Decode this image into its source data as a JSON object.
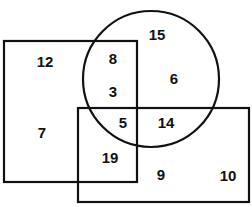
{
  "diagram": {
    "type": "venn-diagram",
    "title": "",
    "background_color": "#ffffff",
    "stroke_color": "#111111",
    "label_color": "#111111",
    "sets": [
      {
        "name": "left-rectangle",
        "shape": "rectangle",
        "x": 4,
        "y": 41,
        "width": 133,
        "height": 141
      },
      {
        "name": "bottom-rectangle",
        "shape": "rectangle",
        "x": 78,
        "y": 108,
        "width": 171,
        "height": 94
      },
      {
        "name": "circle",
        "shape": "circle",
        "cx": 151,
        "cy": 79,
        "r": 68
      }
    ],
    "regions": [
      {
        "id": "rect-left-only-top",
        "value": "12",
        "x": 45,
        "y": 63
      },
      {
        "id": "rect-left-only-bottom",
        "value": "7",
        "x": 42,
        "y": 134
      },
      {
        "id": "circle-rect-left-top",
        "value": "8",
        "x": 113,
        "y": 60
      },
      {
        "id": "circle-rect-left-mid",
        "value": "3",
        "x": 113,
        "y": 93
      },
      {
        "id": "circle-only-top",
        "value": "15",
        "x": 157,
        "y": 36
      },
      {
        "id": "circle-only-right",
        "value": "6",
        "x": 174,
        "y": 80
      },
      {
        "id": "triple-overlap",
        "value": "5",
        "x": 123,
        "y": 124
      },
      {
        "id": "circle-rect-bottom",
        "value": "14",
        "x": 166,
        "y": 124
      },
      {
        "id": "rect-left-rect-bottom",
        "value": "19",
        "x": 110,
        "y": 159
      },
      {
        "id": "rect-bottom-inner",
        "value": "9",
        "x": 161,
        "y": 176
      },
      {
        "id": "rect-bottom-only",
        "value": "10",
        "x": 228,
        "y": 177
      }
    ]
  }
}
